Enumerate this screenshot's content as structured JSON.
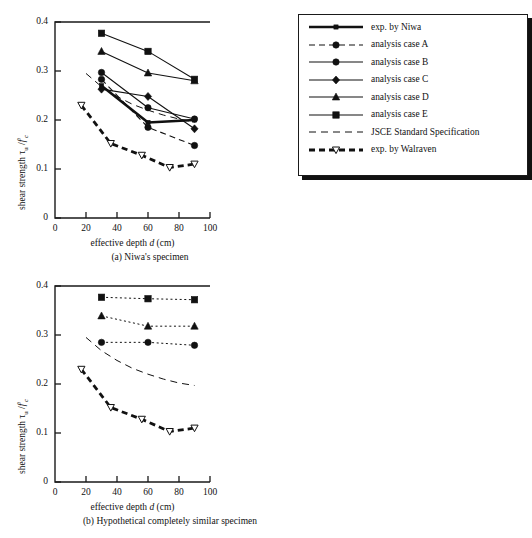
{
  "figure": {
    "y_axis_label_html": "shear strength &tau;<sub>u</sub> /<span class=\"ital\">f</span>'<sub><span class=\"ital\">c</span></sub>",
    "x_axis_label_html": "effective depth <span class=\"ital\">d</span> (cm)",
    "caption_a": "(a) Niwa's specimen",
    "caption_b": "(b) Hypothetical completely similar specimen"
  },
  "legend_a": {
    "items": [
      {
        "label": "exp. by  Niwa",
        "style": "solid-thick",
        "marker": "square-small"
      },
      {
        "label": "analysis case A",
        "style": "dashed",
        "marker": "circle"
      },
      {
        "label": "analysis case B",
        "style": "solid",
        "marker": "circle"
      },
      {
        "label": "analysis case C",
        "style": "solid",
        "marker": "diamond"
      },
      {
        "label": "analysis case D",
        "style": "solid",
        "marker": "triangle-up"
      },
      {
        "label": "analysis case E",
        "style": "solid",
        "marker": "square"
      },
      {
        "label": "JSCE Standard Specification",
        "style": "dashed-thin",
        "marker": "none"
      },
      {
        "label": "exp. by  Walraven",
        "style": "dashed-thick",
        "marker": "triangle-down-open"
      }
    ]
  },
  "legend_b": {
    "items": [
      {
        "label": "analysis case F",
        "style": "dotted",
        "marker": "circle"
      },
      {
        "label": "analysis case G",
        "style": "dotted",
        "marker": "triangle-up"
      },
      {
        "label": "analysis case H",
        "style": "dotted",
        "marker": "square"
      },
      {
        "label": "JSCE Standard Specification",
        "style": "dashed-thin",
        "marker": "none"
      },
      {
        "label": "exp. by  Walraven",
        "style": "dashed-thick",
        "marker": "triangle-down-open"
      }
    ]
  },
  "chart_data": [
    {
      "id": "panel-a",
      "type": "line",
      "title": "(a) Niwa's specimen",
      "xlabel": "effective depth d (cm)",
      "ylabel": "shear strength tau_u / f'_c",
      "xlim": [
        0,
        100
      ],
      "ylim": [
        0,
        0.4
      ],
      "xticks": [
        0,
        20,
        40,
        60,
        80,
        100
      ],
      "yticks": [
        0,
        0.1,
        0.2,
        0.3,
        0.4
      ],
      "ytick_labels": [
        "0",
        "0.1",
        "0.2",
        "0.3",
        "0.4"
      ],
      "xtick_labels": [
        "0",
        "20",
        "40",
        "60",
        "80",
        "100"
      ],
      "grid": false,
      "legend_position": "outside-right",
      "series": [
        {
          "name": "exp. by  Niwa",
          "style": "solid-thick",
          "marker": "square-small",
          "x": [
            30,
            60,
            90
          ],
          "y": [
            0.27,
            0.195,
            0.2
          ]
        },
        {
          "name": "analysis case A",
          "style": "dashed",
          "marker": "circle",
          "x": [
            30,
            60,
            90
          ],
          "y": [
            0.283,
            0.185,
            0.148
          ]
        },
        {
          "name": "analysis case B",
          "style": "solid",
          "marker": "circle",
          "x": [
            30,
            60,
            90
          ],
          "y": [
            0.297,
            0.225,
            0.202
          ]
        },
        {
          "name": "analysis case C",
          "style": "solid",
          "marker": "diamond",
          "x": [
            30,
            60,
            90
          ],
          "y": [
            0.263,
            0.248,
            0.182
          ]
        },
        {
          "name": "analysis case D",
          "style": "solid",
          "marker": "triangle-up",
          "x": [
            30,
            60,
            90
          ],
          "y": [
            0.34,
            0.296,
            0.28
          ]
        },
        {
          "name": "analysis case E",
          "style": "solid",
          "marker": "square",
          "x": [
            30,
            60,
            90
          ],
          "y": [
            0.377,
            0.34,
            0.283
          ]
        },
        {
          "name": "JSCE Standard Specification",
          "style": "dashed-thin",
          "marker": "none",
          "x": [
            20,
            30,
            40,
            50,
            60,
            70,
            80,
            90
          ],
          "y": [
            0.295,
            0.268,
            0.248,
            0.232,
            0.22,
            0.21,
            0.202,
            0.196
          ]
        },
        {
          "name": "exp. by  Walraven",
          "style": "dashed-thick",
          "marker": "triangle-down-open",
          "x": [
            17,
            36,
            56,
            74,
            90
          ],
          "y": [
            0.23,
            0.152,
            0.128,
            0.103,
            0.11
          ]
        }
      ]
    },
    {
      "id": "panel-b",
      "type": "line",
      "title": "(b) Hypothetical completely similar specimen",
      "xlabel": "effective depth d (cm)",
      "ylabel": "shear strength tau_u / f'_c",
      "xlim": [
        0,
        100
      ],
      "ylim": [
        0,
        0.4
      ],
      "xticks": [
        0,
        20,
        40,
        60,
        80,
        100
      ],
      "yticks": [
        0,
        0.1,
        0.2,
        0.3,
        0.4
      ],
      "ytick_labels": [
        "0",
        "0.1",
        "0.2",
        "0.3",
        "0.4"
      ],
      "xtick_labels": [
        "0",
        "20",
        "40",
        "60",
        "80",
        "100"
      ],
      "grid": false,
      "legend_position": "outside-right",
      "series": [
        {
          "name": "analysis case F",
          "style": "dotted",
          "marker": "circle",
          "x": [
            30,
            60,
            90
          ],
          "y": [
            0.285,
            0.285,
            0.279
          ]
        },
        {
          "name": "analysis case G",
          "style": "dotted",
          "marker": "triangle-up",
          "x": [
            30,
            60,
            90
          ],
          "y": [
            0.339,
            0.318,
            0.318
          ]
        },
        {
          "name": "analysis case H",
          "style": "dotted",
          "marker": "square",
          "x": [
            30,
            60,
            90
          ],
          "y": [
            0.377,
            0.374,
            0.372
          ]
        },
        {
          "name": "JSCE Standard Specification",
          "style": "dashed-thin",
          "marker": "none",
          "x": [
            20,
            30,
            40,
            50,
            60,
            70,
            80,
            90
          ],
          "y": [
            0.295,
            0.268,
            0.248,
            0.232,
            0.22,
            0.21,
            0.202,
            0.197
          ]
        },
        {
          "name": "exp. by  Walraven",
          "style": "dashed-thick",
          "marker": "triangle-down-open",
          "x": [
            17,
            36,
            56,
            74,
            90
          ],
          "y": [
            0.23,
            0.152,
            0.128,
            0.103,
            0.11
          ]
        }
      ]
    }
  ]
}
